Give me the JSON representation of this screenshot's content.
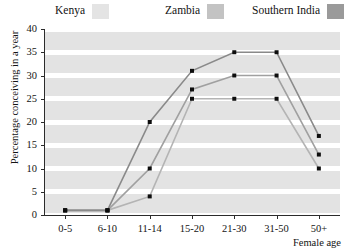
{
  "legend": {
    "items": [
      {
        "label": "Kenya",
        "color": "#e4e4e4",
        "x": 55,
        "label_x": 0
      },
      {
        "label": "Zambia",
        "color": "#c3c3c3",
        "x": 165,
        "label_x": 0
      },
      {
        "label": "Southern India",
        "color": "#9a9a9a",
        "x": 252,
        "label_x": 0
      }
    ]
  },
  "axes": {
    "ylabel": "Percentage conceiving in a year",
    "xlabel": "Female age",
    "yticks": [
      "0",
      "5",
      "10",
      "15",
      "20",
      "25",
      "30",
      "35",
      "40"
    ],
    "xticks": [
      "0-5",
      "6-10",
      "11-14",
      "15-20",
      "21-30",
      "31-50",
      "50+"
    ]
  },
  "chart_data": {
    "type": "line",
    "title": "",
    "xlabel": "Female age",
    "ylabel": "Percentage conceiving in a year",
    "categories": [
      "0-5",
      "6-10",
      "11-14",
      "15-20",
      "21-30",
      "31-50",
      "50+"
    ],
    "ylim": [
      0,
      40
    ],
    "ytick_step": 5,
    "grid": "horizontal-bands",
    "legend_position": "top",
    "marker": "square",
    "series": [
      {
        "name": "Kenya",
        "color": "#e4e4e4",
        "line_color": "#b4b4b4",
        "values": [
          1,
          1,
          4,
          25,
          25,
          25,
          10
        ]
      },
      {
        "name": "Zambia",
        "color": "#c3c3c3",
        "line_color": "#a0a0a0",
        "values": [
          1,
          1,
          10,
          27,
          30,
          30,
          13
        ]
      },
      {
        "name": "Southern India",
        "color": "#9a9a9a",
        "line_color": "#8a8a8a",
        "values": [
          1,
          1,
          20,
          31,
          35,
          35,
          17
        ]
      }
    ]
  }
}
